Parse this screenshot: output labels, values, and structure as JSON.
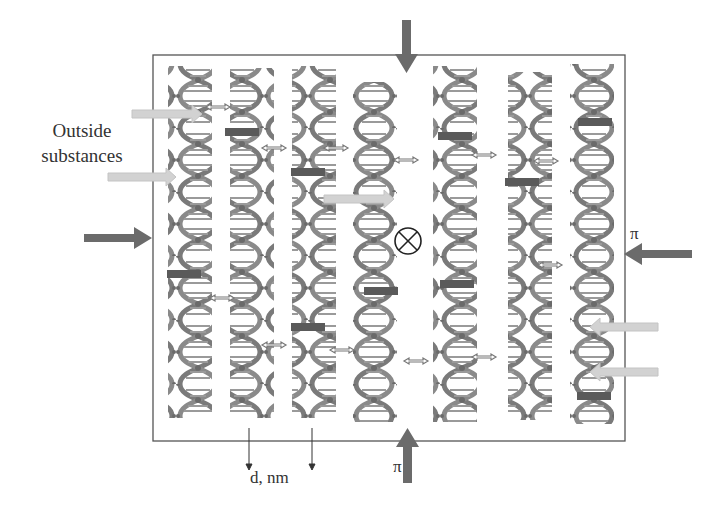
{
  "labels": {
    "outside_substances": "Outside substances",
    "pi_right": "π",
    "pi_bottom": "π",
    "spacing": "d, nm"
  },
  "symbols": {
    "center_marker": "⊗"
  },
  "icons": {
    "pressure_arrow": "dark-grey-block-arrow",
    "substance_arrow": "light-grey-block-arrow",
    "interaction_arrow": "double-headed-arrow",
    "helix": "dna-double-helix"
  },
  "colors": {
    "pressure_arrow": "#6b6b6b",
    "substance_arrow": "#cfcfcf",
    "helix": "#7a7a7a",
    "box_border": "#555555",
    "text": "#333333"
  },
  "helices": {
    "count": 7,
    "centers_x": [
      190,
      252,
      314,
      375,
      455,
      530,
      592
    ]
  }
}
